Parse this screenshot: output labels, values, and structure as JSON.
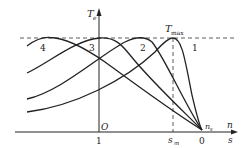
{
  "diagram": {
    "y_axis": {
      "label": "T",
      "label_sub": "e"
    },
    "x_axis": {
      "label_top": "n",
      "label_bottom": "s"
    },
    "origin_label": "O",
    "tmax_label": "T",
    "tmax_sub": "max",
    "ticks": {
      "s_one": "1",
      "s_m": "s",
      "s_m_sub": "m",
      "zero": "0",
      "ns": "n",
      "ns_sub": "s"
    },
    "curves": [
      {
        "id": "1",
        "label": "1",
        "peak_x": 173
      },
      {
        "id": "2",
        "label": "2",
        "peak_x": 141
      },
      {
        "id": "3",
        "label": "3",
        "peak_x": 100
      },
      {
        "id": "4",
        "label": "4",
        "peak_x": 50
      }
    ]
  }
}
